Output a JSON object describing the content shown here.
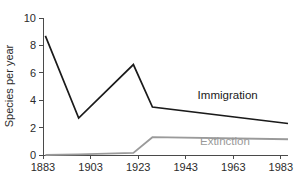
{
  "chart_data": {
    "type": "line",
    "title": "",
    "xlabel": "",
    "ylabel": "Species per year",
    "xlim": [
      1883,
      1986
    ],
    "ylim": [
      0,
      10
    ],
    "xticks": [
      1883,
      1903,
      1923,
      1943,
      1963,
      1983
    ],
    "yticks": [
      0,
      2,
      4,
      6,
      8,
      10
    ],
    "grid": false,
    "legend_position": "inline-annotation",
    "series": [
      {
        "name": "Immigration",
        "color": "#1a1a1a",
        "x": [
          1884,
          1898,
          1921,
          1929,
          1986
        ],
        "values": [
          8.7,
          2.7,
          6.6,
          3.5,
          2.3
        ],
        "label_x": 1948,
        "label_y": 4.1
      },
      {
        "name": "Extinction",
        "color": "#9a9a9a",
        "x": [
          1884,
          1898,
          1921,
          1929,
          1986
        ],
        "values": [
          0.0,
          0.05,
          0.15,
          1.3,
          1.15
        ],
        "label_x": 1949,
        "label_y": 0.75
      }
    ]
  },
  "axes": {
    "y_axis_title": "Species per year",
    "y_tick_labels": [
      "0",
      "2",
      "4",
      "6",
      "8",
      "10"
    ],
    "x_tick_labels": [
      "1883",
      "1903",
      "1923",
      "1943",
      "1963",
      "1983"
    ]
  },
  "annotations": {
    "immigration_label": "Immigration",
    "extinction_label": "Extinction"
  },
  "colors": {
    "immigration": "#1a1a1a",
    "extinction": "#9a9a9a",
    "axis": "#4a4a4a",
    "text": "#2b2b2b",
    "background": "#ffffff"
  }
}
